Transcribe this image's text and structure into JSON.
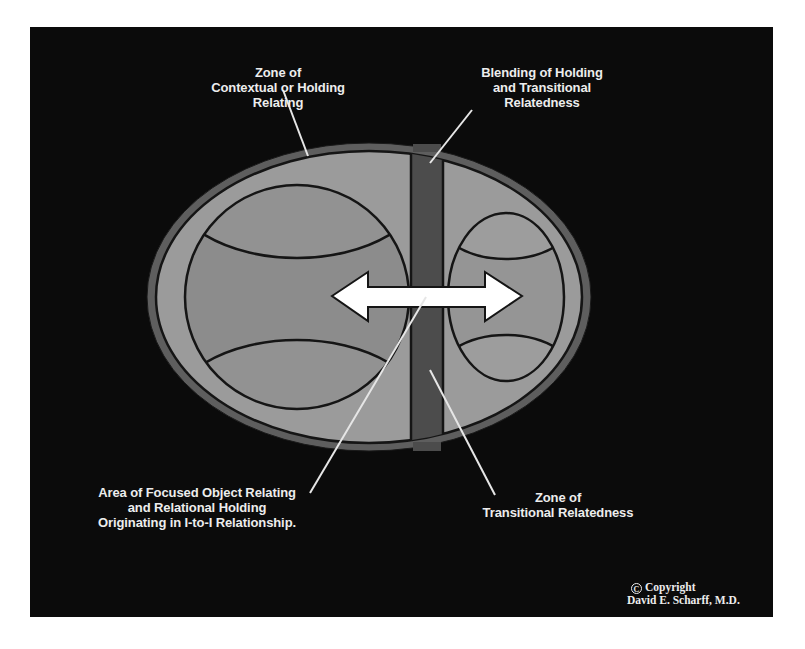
{
  "diagram": {
    "colors": {
      "background_panel": "#0b0b0b",
      "outer_rim": "#5e5e5e",
      "light_zone": "#9a9a9a",
      "inner_circle_fill": "#8a8a8a",
      "blending_band": "#4a4a4a",
      "outline": "#111111",
      "arrow": "#ffffff",
      "label_text": "#ededed",
      "pointer_lines": "#e6e6e6"
    },
    "shapes": {
      "outer_ellipse": {
        "cx": 369,
        "cy": 297,
        "rx": 222,
        "ry": 154
      },
      "blending_band": {
        "x": 411,
        "width": 32
      },
      "left_circle": {
        "cx": 297,
        "cy": 297,
        "r": 112
      },
      "right_circle": {
        "cx": 506,
        "cy": 297,
        "rx": 58,
        "ry": 84
      },
      "arrow": {
        "left_tip": 332,
        "right_tip": 522,
        "y": 297,
        "double_headed": true
      }
    },
    "labels": {
      "contextual_zone": {
        "lines": [
          "Zone of",
          "Contextual or Holding",
          "Relating"
        ]
      },
      "blending_zone": {
        "lines": [
          "Blending of Holding",
          "and Transitional",
          "Relatedness"
        ]
      },
      "focused_area": {
        "lines": [
          "Area of Focused Object Relating",
          "and Relational Holding",
          "Originating in I-to-I Relationship."
        ]
      },
      "transitional_zone": {
        "lines": [
          "Zone of",
          "Transitional Relatedness"
        ]
      }
    },
    "copyright": {
      "symbol": "C",
      "line1": "Copyright",
      "line2": "David E. Scharff, M.D."
    },
    "icons": {
      "arrow": "double-headed-arrow-icon",
      "copyright": "copyright-icon"
    }
  }
}
